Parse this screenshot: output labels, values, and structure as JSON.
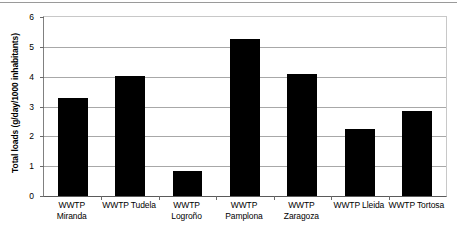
{
  "chart_data": {
    "type": "bar",
    "title": "",
    "xlabel": "",
    "ylabel": "Total loads (g/day/1000 inhabitants)",
    "categories": [
      "WWTP Miranda",
      "WWTP Tudela",
      "WWTP Logroño",
      "WWTP Pamplona",
      "WWTP Zaragoza",
      "WWTP Lleida",
      "WWTP Tortosa"
    ],
    "category_lines": [
      [
        "WWTP",
        "Miranda"
      ],
      [
        "WWTP Tudela",
        ""
      ],
      [
        "WWTP",
        "Logroño"
      ],
      [
        "WWTP",
        "Pamplona"
      ],
      [
        "WWTP",
        "Zaragoza"
      ],
      [
        "WWTP Lleida",
        ""
      ],
      [
        "WWTP Tortosa",
        ""
      ]
    ],
    "values": [
      3.27,
      4.03,
      0.85,
      5.25,
      4.1,
      2.25,
      2.85
    ],
    "ylim": [
      0,
      6
    ],
    "ytick_labels": [
      "0",
      "1",
      "2",
      "3",
      "4",
      "5",
      "6"
    ],
    "ytick_values": [
      0,
      1,
      2,
      3,
      4,
      5,
      6
    ],
    "grid": "horizontal",
    "legend": "none",
    "bar_color": "#000000",
    "gridline_color": "#a8a8a8",
    "axis_color": "#5a5a5a",
    "background_color": "#ffffff"
  }
}
